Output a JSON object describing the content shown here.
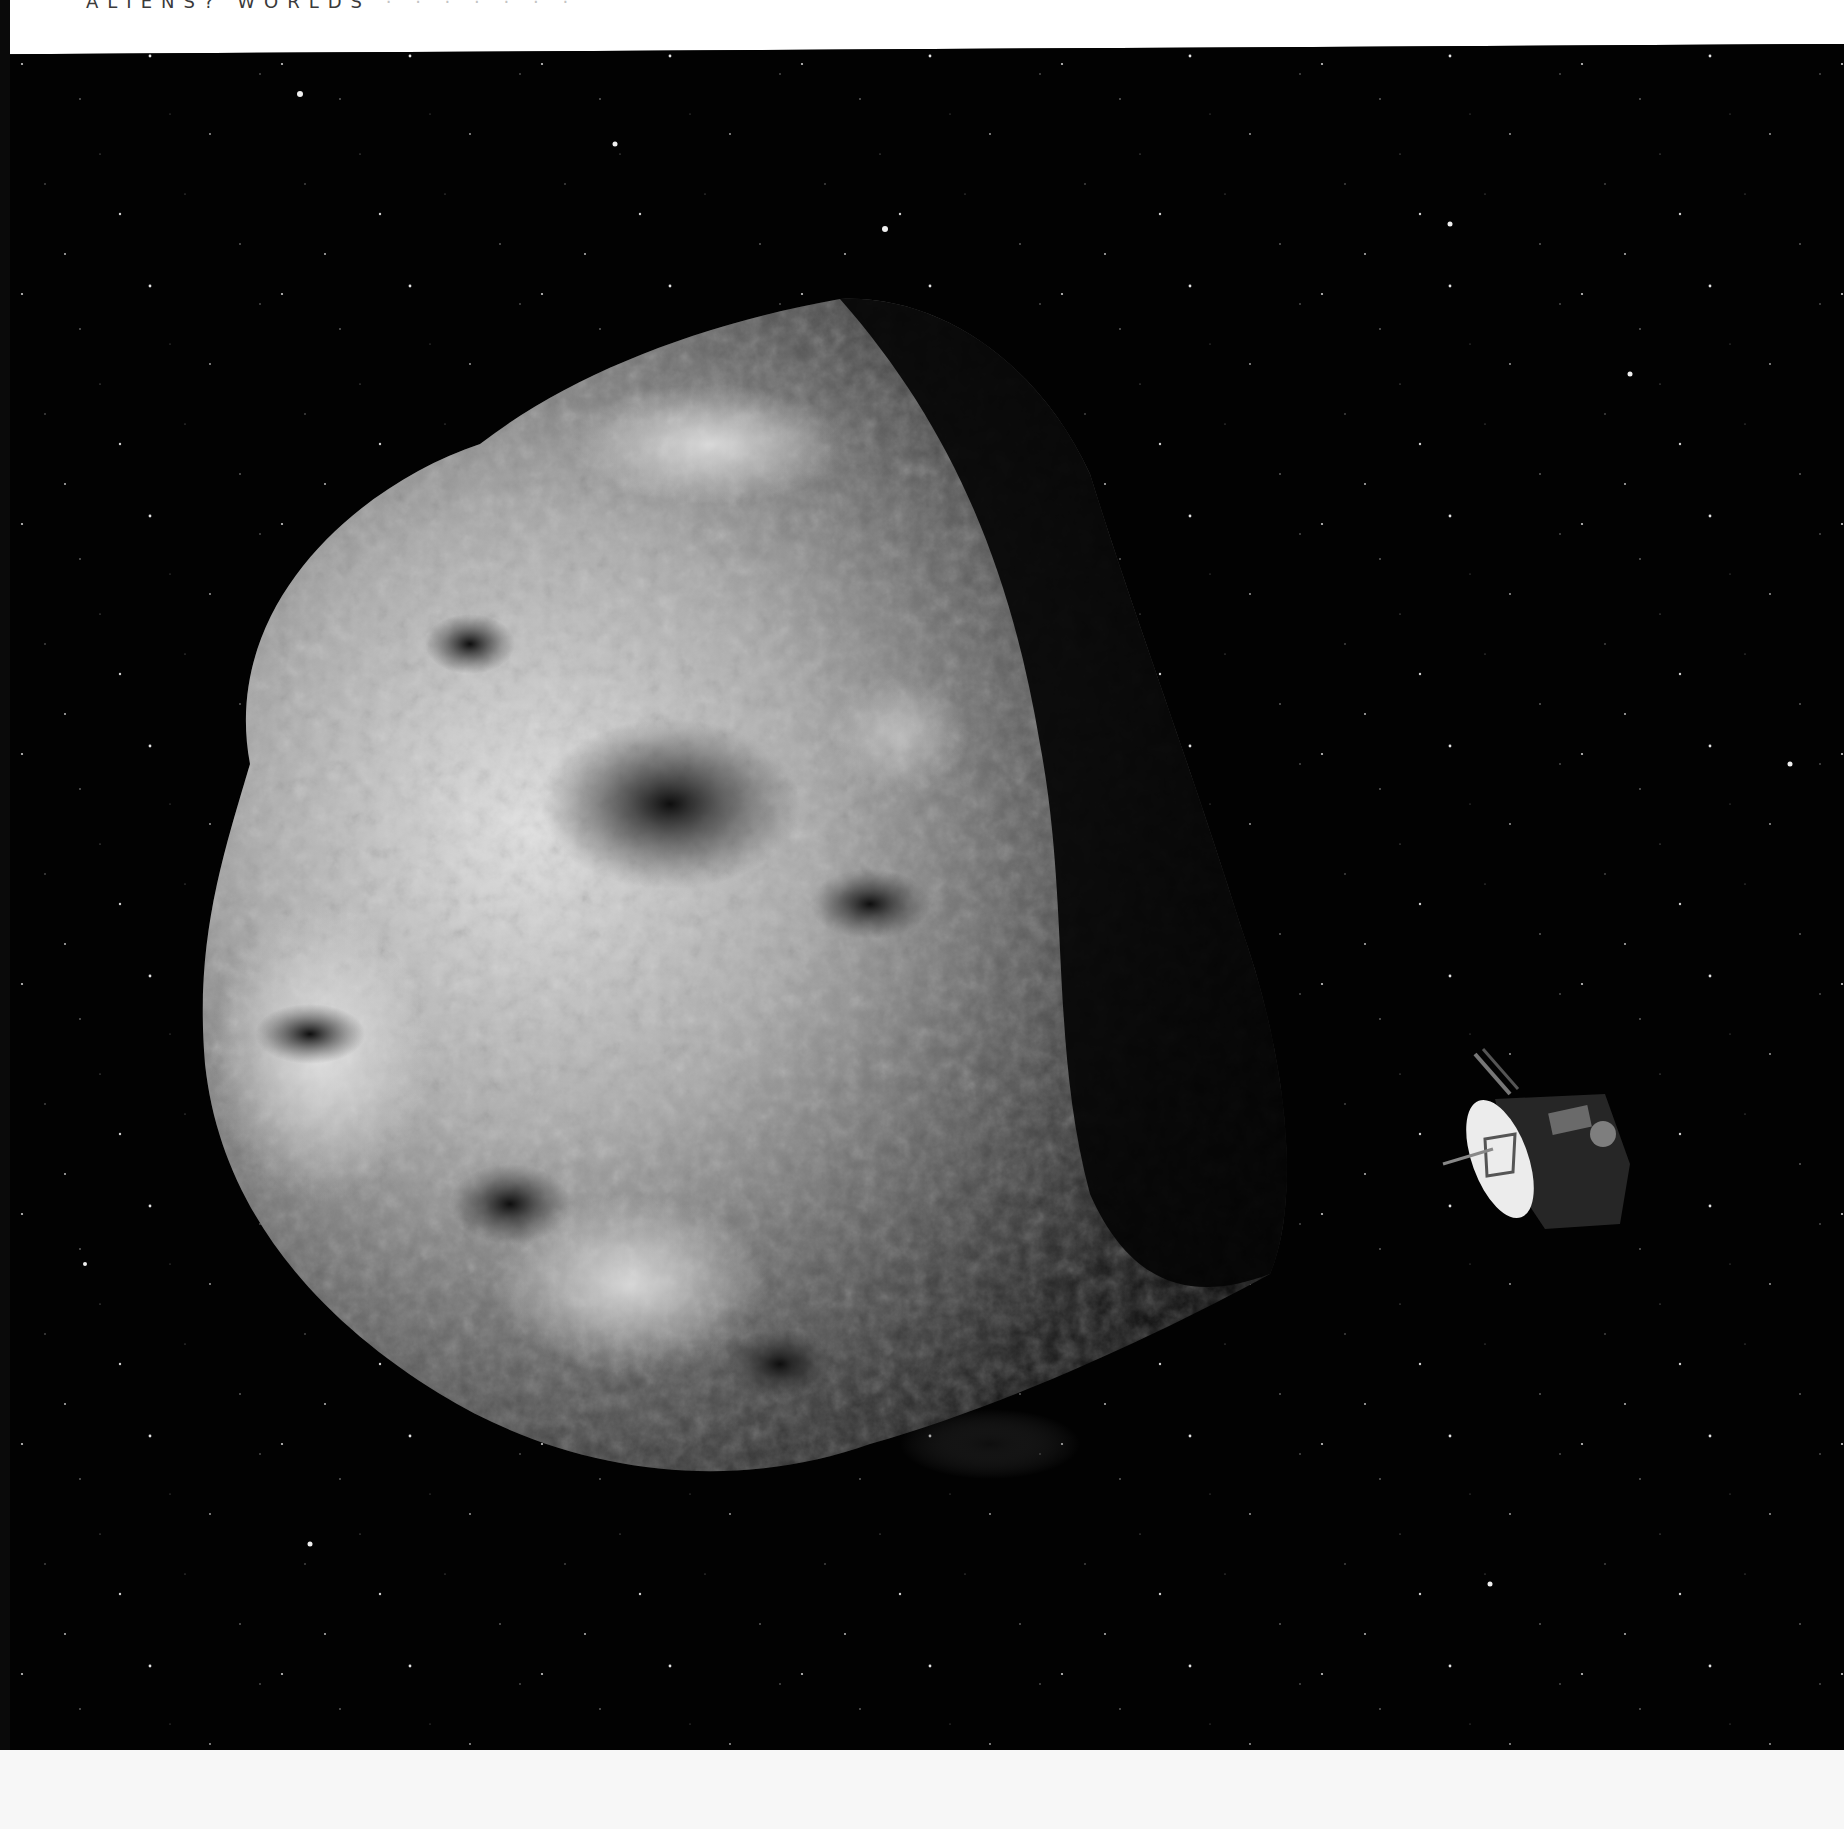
{
  "page": {
    "running_head": {
      "text": "ALIENS? WORLDS",
      "faded_suffix": "· · · · · · ·"
    },
    "figure": {
      "subject": "Illustration of an irregular cratered asteroid with a spacecraft approaching",
      "elements": {
        "asteroid": "asteroid",
        "spacecraft": "spacecraft with dish antenna",
        "background": "star field"
      },
      "colors": {
        "space": "#020202",
        "asteroid_light": "#d8d8d8",
        "asteroid_mid": "#8a8a8a",
        "asteroid_shadow": "#1a1a1a",
        "page": "#ffffff"
      }
    }
  }
}
